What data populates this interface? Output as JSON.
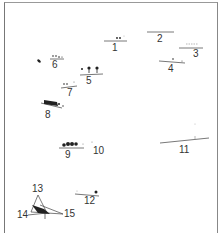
{
  "figure": {
    "labels": [
      {
        "id": "1",
        "text": "1"
      },
      {
        "id": "2",
        "text": "2"
      },
      {
        "id": "3",
        "text": "3"
      },
      {
        "id": "4",
        "text": "4"
      },
      {
        "id": "5",
        "text": "5"
      },
      {
        "id": "6",
        "text": "6"
      },
      {
        "id": "7",
        "text": "7"
      },
      {
        "id": "8",
        "text": "8"
      },
      {
        "id": "9",
        "text": "9"
      },
      {
        "id": "10",
        "text": "10"
      },
      {
        "id": "11",
        "text": "11"
      },
      {
        "id": "12",
        "text": "12"
      },
      {
        "id": "13",
        "text": "13"
      },
      {
        "id": "14",
        "text": "14"
      },
      {
        "id": "15",
        "text": "15"
      }
    ],
    "colors": {
      "ink": "#222222",
      "line": "#555555",
      "frame": "#888888"
    }
  }
}
